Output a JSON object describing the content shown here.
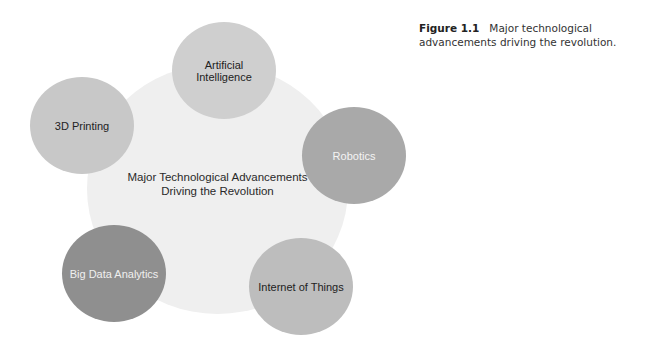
{
  "caption": {
    "label": "Figure 1.1",
    "text": "Major technological advancements driving the revolution."
  },
  "diagram": {
    "center": {
      "line1": "Major Technological Advancements",
      "line2": "Driving the Revolution",
      "color": "#efefef"
    },
    "nodes": [
      {
        "label": "Artificial Intelligence",
        "color": "#cfcfcf",
        "text_color": "#222222"
      },
      {
        "label": "Robotics",
        "color": "#a9a9a9",
        "text_color": "#f4f4f4"
      },
      {
        "label": "Internet of Things",
        "color": "#bdbdbd",
        "text_color": "#222222"
      },
      {
        "label": "Big Data Analytics",
        "color": "#8f8f8f",
        "text_color": "#f0f0f0"
      },
      {
        "label": "3D Printing",
        "color": "#c8c8c8",
        "text_color": "#222222"
      }
    ]
  }
}
